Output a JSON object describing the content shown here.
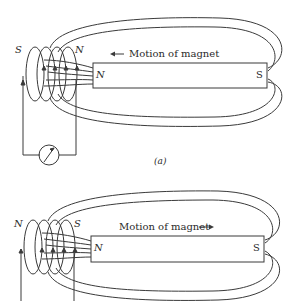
{
  "figure": {
    "panels": [
      {
        "id": "a",
        "caption": "(a)",
        "motion_label": "Motion of magnet",
        "motion_direction": "left",
        "magnet": {
          "near_pole": "N",
          "far_pole": "S"
        },
        "coil": {
          "left_pole": "S",
          "right_pole": "N",
          "current_arrow": "down"
        },
        "galvanometer": true
      },
      {
        "id": "b",
        "caption": "(b)",
        "motion_label": "Motion of magnet",
        "motion_direction": "right",
        "magnet": {
          "near_pole": "N",
          "far_pole": "S"
        },
        "coil": {
          "left_pole": "N",
          "right_pole": "S",
          "current_arrow": "up"
        },
        "galvanometer": false
      }
    ],
    "colors": {
      "line": "#3a3a3a",
      "background": "#ffffff"
    }
  }
}
